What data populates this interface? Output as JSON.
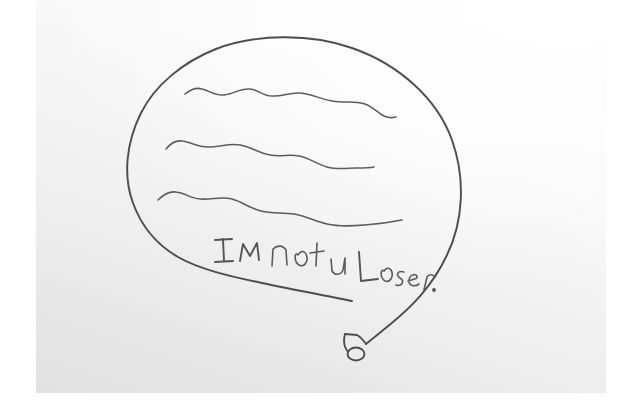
{
  "image": {
    "title": "Hand-drawn speech bubble on scanned paper",
    "medium": "pencil on paper, scanned",
    "width": 633,
    "height": 420,
    "page_background_color": "#ffffff",
    "paper_color": "#f2f2f2",
    "pencil_color": "#4d4d50"
  },
  "drawing": {
    "shape_label": "speech-bubble",
    "scribble_lines_count": 3,
    "scribble_lines_label": "wavy scribble lines standing in for unreadable text",
    "tail_label": "speech bubble tail ending in a small circle",
    "tail_end_marker": "small oval loop"
  },
  "handwriting": {
    "text": "I M not u Loser.",
    "words": [
      "I",
      "M",
      "not",
      "u",
      "Loser."
    ],
    "line_label": "handwritten caption inside speech bubble",
    "trailing_punctuation": "."
  }
}
